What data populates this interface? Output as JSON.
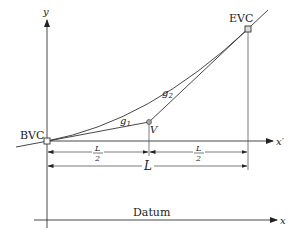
{
  "diagram": {
    "type": "vertical-curve",
    "axes": {
      "y_label": "y",
      "x_prime_label": "x′",
      "x_label": "x"
    },
    "points": {
      "bvc": {
        "label": "BVC",
        "x": 47,
        "y": 141
      },
      "v": {
        "label": "V",
        "x": 149,
        "y": 122
      },
      "evc": {
        "label": "EVC",
        "x": 248,
        "y": 29
      }
    },
    "grades": {
      "g1": {
        "base": "g",
        "sub": "1"
      },
      "g2": {
        "base": "g",
        "sub": "2"
      }
    },
    "dimensions": {
      "half_left": {
        "num": "L",
        "den": "2"
      },
      "half_right": {
        "num": "L",
        "den": "2"
      },
      "total": "L"
    },
    "datum_label": "Datum"
  }
}
